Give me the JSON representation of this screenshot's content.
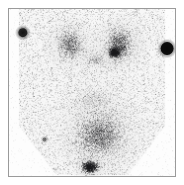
{
  "viewer": {
    "title": "Nuclear Medicine Scintigram",
    "modality": "scintigraphy",
    "background_color": "#ffffff",
    "frame_border_color": "#9a9a9a",
    "field_color": "#fdfdfd"
  },
  "chart_data": {
    "type": "heatmap",
    "subtitle": "",
    "xlabel": "",
    "ylabel": "",
    "grid": false,
    "legend": "none",
    "colormap": "grayscale-inverted",
    "xlim": [
      0,
      168
    ],
    "ylim": [
      0,
      169
    ],
    "background_intensity": 0.03,
    "noise": {
      "speckle_count": 13000,
      "speckle_min_alpha": 0.03,
      "speckle_max_alpha": 0.3,
      "speckle_size_px": 1
    },
    "body_outline": {
      "description": "broad trapezoidal soft-tissue silhouette, shoulders flaring at upper corners, tapering to lower center",
      "points": [
        [
          10,
          0
        ],
        [
          158,
          0
        ],
        [
          158,
          118
        ],
        [
          120,
          168
        ],
        [
          48,
          168
        ],
        [
          10,
          118
        ]
      ]
    },
    "regions": [
      {
        "name": "left-thyroid-lobe",
        "label": "Left lobe uptake",
        "cx": 62,
        "cy": 36,
        "rx": 26,
        "ry": 30,
        "intensity": 0.42,
        "density": 900
      },
      {
        "name": "right-thyroid-lobe",
        "label": "Right lobe uptake",
        "cx": 112,
        "cy": 36,
        "rx": 26,
        "ry": 32,
        "intensity": 0.52,
        "density": 1050
      },
      {
        "name": "right-lobe-hot-focus",
        "label": "Focal intense uptake, right lobe",
        "cx": 107,
        "cy": 44,
        "rx": 11,
        "ry": 10,
        "intensity": 0.85,
        "density": 700
      },
      {
        "name": "isthmus-bridge",
        "label": "Isthmus / midline activity",
        "cx": 88,
        "cy": 52,
        "rx": 20,
        "ry": 12,
        "intensity": 0.22,
        "density": 220
      },
      {
        "name": "mediastinal-blood-pool",
        "label": "Cardiac / mediastinal blood pool",
        "cx": 92,
        "cy": 128,
        "rx": 50,
        "ry": 44,
        "intensity": 0.4,
        "density": 2600
      },
      {
        "name": "inferior-hot-focus",
        "label": "Inferior focal uptake",
        "cx": 82,
        "cy": 160,
        "rx": 16,
        "ry": 12,
        "intensity": 0.72,
        "density": 900
      },
      {
        "name": "upper-mediastinum-diffuse",
        "label": "Diffuse upper mediastinal activity",
        "cx": 86,
        "cy": 92,
        "rx": 44,
        "ry": 26,
        "intensity": 0.15,
        "density": 600
      }
    ],
    "markers": [
      {
        "name": "fiducial-marker-left",
        "label": "Left fiducial point source",
        "cx": 14,
        "cy": 24,
        "r": 4.5,
        "intensity": 0.78,
        "halo_r": 8
      },
      {
        "name": "fiducial-marker-right",
        "label": "Right fiducial point source",
        "cx": 160,
        "cy": 40,
        "r": 6.5,
        "intensity": 0.97,
        "halo_r": 10
      },
      {
        "name": "fiducial-marker-lower-left",
        "label": "Faint lower left point marker",
        "cx": 36,
        "cy": 132,
        "r": 2.0,
        "intensity": 0.35,
        "halo_r": 4
      }
    ]
  }
}
